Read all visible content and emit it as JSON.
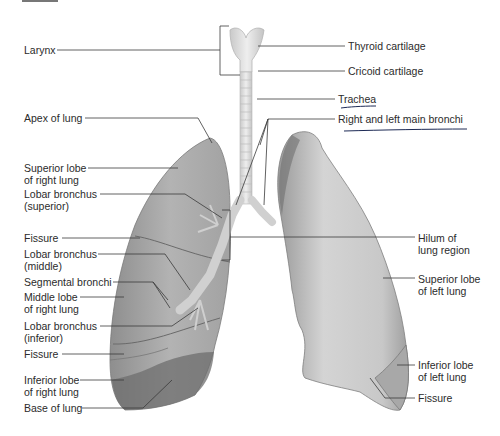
{
  "diagram": {
    "labels_left": [
      {
        "id": "larynx",
        "lines": [
          "Larynx"
        ]
      },
      {
        "id": "apex",
        "lines": [
          "Apex of lung"
        ]
      },
      {
        "id": "superior-lobe-right",
        "lines": [
          "Superior lobe",
          "of right lung"
        ]
      },
      {
        "id": "lobar-bronchus-superior",
        "lines": [
          "Lobar bronchus",
          "(superior)"
        ]
      },
      {
        "id": "fissure-1",
        "lines": [
          "Fissure"
        ]
      },
      {
        "id": "lobar-bronchus-middle",
        "lines": [
          "Lobar bronchus",
          "(middle)"
        ]
      },
      {
        "id": "segmental-bronchi",
        "lines": [
          "Segmental bronchi"
        ]
      },
      {
        "id": "middle-lobe-right",
        "lines": [
          "Middle lobe",
          "of right lung"
        ]
      },
      {
        "id": "lobar-bronchus-inferior",
        "lines": [
          "Lobar bronchus",
          "(inferior)"
        ]
      },
      {
        "id": "fissure-2",
        "lines": [
          "Fissure"
        ]
      },
      {
        "id": "inferior-lobe-right",
        "lines": [
          "Inferior lobe",
          "of right lung"
        ]
      },
      {
        "id": "base",
        "lines": [
          "Base of lung"
        ]
      }
    ],
    "labels_right": [
      {
        "id": "thyroid-cartilage",
        "lines": [
          "Thyroid cartilage"
        ]
      },
      {
        "id": "cricoid-cartilage",
        "lines": [
          "Cricoid cartilage"
        ]
      },
      {
        "id": "trachea",
        "lines": [
          "Trachea"
        ],
        "underlined": true
      },
      {
        "id": "main-bronchi",
        "lines": [
          "Right and left main bronchi"
        ],
        "underlined": true
      },
      {
        "id": "hilum",
        "lines": [
          "Hilum of",
          "lung region"
        ]
      },
      {
        "id": "superior-lobe-left",
        "lines": [
          "Superior lobe",
          "of left lung"
        ]
      },
      {
        "id": "inferior-lobe-left",
        "lines": [
          "Inferior lobe",
          "of left lung"
        ]
      },
      {
        "id": "fissure-left",
        "lines": [
          "Fissure"
        ]
      }
    ],
    "colors": {
      "text": "#2b2b2b",
      "leader": "#3a3a3a",
      "lung_right": "#a9a9a9",
      "lung_left": "#c4c4c4",
      "trachea": "#d9d9d9",
      "handwriting": "#1d2a55"
    }
  }
}
